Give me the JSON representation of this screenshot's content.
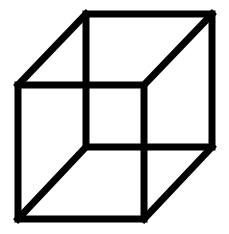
{
  "diagram": {
    "stroke_color": "#000000",
    "background": "#ffffff",
    "stroke_width": 7,
    "front_face": {
      "x1": 18,
      "y1": 85,
      "x2": 144,
      "y2": 219
    },
    "back_face": {
      "x1": 86,
      "y1": 14,
      "x2": 212,
      "y2": 147
    }
  }
}
